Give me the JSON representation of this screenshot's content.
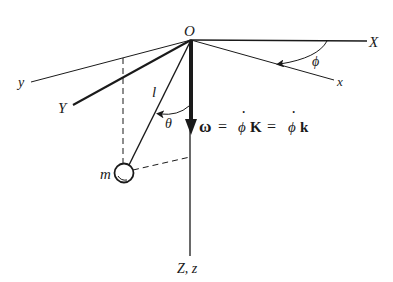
{
  "diagram": {
    "type": "spherical-pendulum-rotating-frame",
    "labels": {
      "origin": "O",
      "fixed_x_axis": "X",
      "rotating_x_axis": "x",
      "fixed_y_axis": "Y",
      "rotating_y_axis": "y",
      "vertical_axis": "Z, z",
      "pendulum_length": "l",
      "polar_angle": "θ",
      "azimuth_angle": "ϕ",
      "mass": "m"
    },
    "equation": {
      "omega": "ω",
      "eq1": "=",
      "phidot1": "ϕ",
      "K": "K",
      "eq2": "=",
      "phidot2": "ϕ",
      "k": "k",
      "dot": "·"
    },
    "colors": {
      "ink": "#1a1a1a",
      "background": "#ffffff"
    }
  }
}
